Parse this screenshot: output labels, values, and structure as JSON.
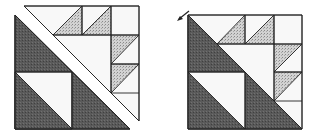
{
  "figure": {
    "colors": {
      "dark_fabric": "#555555",
      "light_print": "#c8c8c8",
      "background_fabric": "#f7f7f7",
      "outline": "#222222"
    },
    "panels": [
      {
        "name": "separated-pieces"
      },
      {
        "name": "assembled-block"
      }
    ],
    "arrow": {
      "direction": "down-left"
    }
  }
}
